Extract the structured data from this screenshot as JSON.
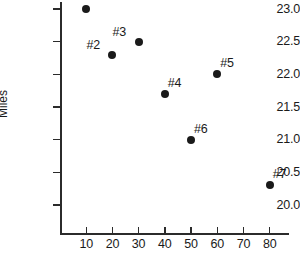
{
  "chart_data": {
    "type": "scatter",
    "title": "",
    "xlabel": "",
    "ylabel": "Miles",
    "xlim": [
      0,
      87
    ],
    "ylim": [
      19.75,
      23.22
    ],
    "grid": false,
    "legend": false,
    "xticks": [
      10,
      20,
      30,
      40,
      50,
      60,
      70,
      80
    ],
    "xtick_labels": [
      "10",
      "20",
      "30",
      "40",
      "50",
      "60",
      "70",
      "80"
    ],
    "yticks": [
      20.0,
      20.5,
      21.0,
      21.5,
      22.0,
      22.5,
      23.0
    ],
    "ytick_labels": [
      "20.0",
      "20.5",
      "21.0",
      "21.5",
      "22.0",
      "22.5",
      "23.0"
    ],
    "marker_color": "#1a1a1a",
    "axis_color": "#2b2b2b",
    "points": [
      {
        "label": "#1",
        "x": 10,
        "y": 23.0,
        "label_pos": "top"
      },
      {
        "label": "#2",
        "x": 20,
        "y": 22.3,
        "label_pos": "top-left"
      },
      {
        "label": "#3",
        "x": 30,
        "y": 22.5,
        "label_pos": "top-left"
      },
      {
        "label": "#4",
        "x": 40,
        "y": 21.7,
        "label_pos": "top-right"
      },
      {
        "label": "#5",
        "x": 60,
        "y": 22.0,
        "label_pos": "top-right"
      },
      {
        "label": "#6",
        "x": 50,
        "y": 21.0,
        "label_pos": "top-right"
      },
      {
        "label": "#7",
        "x": 80,
        "y": 20.3,
        "label_pos": "top-right"
      }
    ]
  }
}
